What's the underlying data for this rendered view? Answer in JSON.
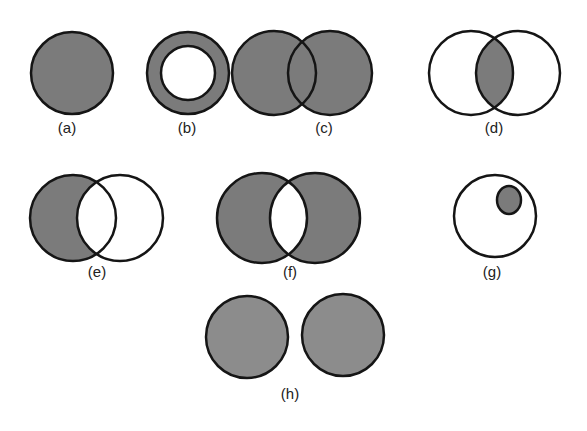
{
  "figure": {
    "colors": {
      "fill": "#7b7b7b",
      "fill_light": "#8c8c8c",
      "stroke": "#151515",
      "background": "#ffffff"
    },
    "panels": [
      {
        "id": "a",
        "label": "(a)",
        "description": "Single shaded circle"
      },
      {
        "id": "b",
        "label": "(b)",
        "description": "Shaded ring (circle with unshaded inner circle)"
      },
      {
        "id": "c",
        "label": "(c)",
        "description": "Two overlapping circles, union shaded"
      },
      {
        "id": "d",
        "label": "(d)",
        "description": "Two overlapping circles, intersection shaded"
      },
      {
        "id": "e",
        "label": "(e)",
        "description": "Two overlapping circles, left-only region shaded (difference)"
      },
      {
        "id": "f",
        "label": "(f)",
        "description": "Two overlapping circles, symmetric difference shaded"
      },
      {
        "id": "g",
        "label": "(g)",
        "description": "Small shaded circle contained inside larger unshaded circle (subset)"
      },
      {
        "id": "h",
        "label": "(h)",
        "description": "Two disjoint shaded circles"
      }
    ]
  }
}
